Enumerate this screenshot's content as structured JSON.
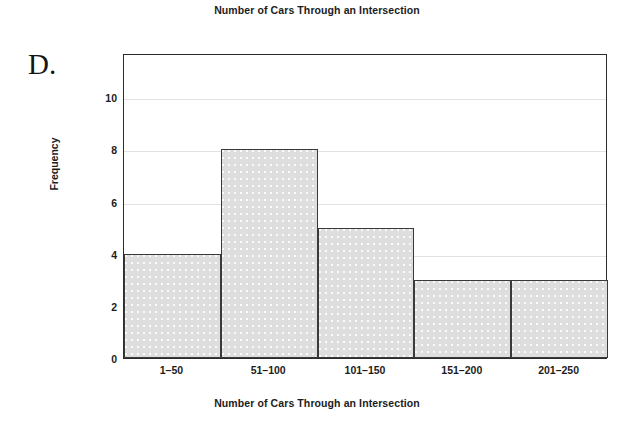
{
  "panel": {
    "letter": "D."
  },
  "chart_data": {
    "type": "bar",
    "title": "Number of Cars Through an Intersection",
    "xlabel": "Number of Cars Through an Intersection",
    "ylabel": "Frequency",
    "categories": [
      "1–50",
      "51–100",
      "101–150",
      "151–200",
      "201–250"
    ],
    "values": [
      4,
      8,
      5,
      3,
      3
    ],
    "ylim": [
      0,
      11.7
    ],
    "yticks": [
      0,
      2,
      4,
      6,
      8,
      10
    ],
    "ytick_labels": [
      "0",
      "2",
      "4",
      "6",
      "8",
      "10"
    ],
    "grid": true,
    "grid_axis": "y",
    "legend": "none",
    "bar_style": "histogram-adjacent",
    "colors": {
      "bar_fill": "#dedede",
      "bar_edge": "#3a3a3a",
      "axis": "#2b2b2b",
      "gridline": "#e2e2e2",
      "text": "#1c1c1c",
      "background": "#ffffff"
    }
  }
}
